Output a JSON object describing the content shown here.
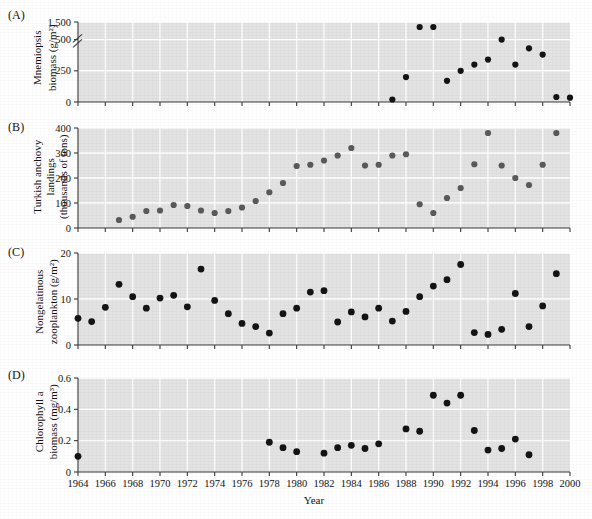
{
  "figure": {
    "background": "#ffffff",
    "panel_bg": "#e3e3e3",
    "gridline_color": "#ffffff",
    "axis_color": "#3a3a3a",
    "xaxis_title": "Year",
    "x_ticks": [
      "1964",
      "1966",
      "1968",
      "1970",
      "1972",
      "1974",
      "1976",
      "1978",
      "1980",
      "1982",
      "1984",
      "1986",
      "1988",
      "1990",
      "1992",
      "1994",
      "1996",
      "1998",
      "2000"
    ],
    "x_range": [
      1964,
      2000
    ]
  },
  "panels": [
    {
      "letter": "(A)",
      "ylabel_line1": "Mnemiopsis",
      "ylabel_line1_italic": true,
      "ylabel_line2": "biomass (g/m²)",
      "y_ticks": [
        "0",
        "250",
        "500",
        "1,500"
      ],
      "y_tick_values": [
        0,
        250,
        500,
        1500
      ],
      "axis_break": true,
      "marker_color": "#141414",
      "marker_radius": 3.1
    },
    {
      "letter": "(B)",
      "ylabel_line1": "Turkish anchovy",
      "ylabel_line2": "landings",
      "ylabel_line3": "(thousands of tons)",
      "y_ticks": [
        "0",
        "100",
        "200",
        "300",
        "400"
      ],
      "y_tick_values": [
        0,
        100,
        200,
        300,
        400
      ],
      "axis_break": false,
      "marker_color": "#5a5a5a",
      "marker_radius": 3.1
    },
    {
      "letter": "(C)",
      "ylabel_line1": "Nongelatinous",
      "ylabel_line2": "zooplankton (g/m²)",
      "y_ticks": [
        "0",
        "10",
        "20"
      ],
      "y_tick_values": [
        0,
        10,
        20
      ],
      "axis_break": false,
      "marker_color": "#141414",
      "marker_radius": 3.4
    },
    {
      "letter": "(D)",
      "ylabel_line1": "Chlorophyll a",
      "ylabel_line1_italic_last": true,
      "ylabel_line2": "biomass (mg/m³)",
      "y_ticks": [
        "0",
        "0.2",
        "0.4",
        "0.6"
      ],
      "y_tick_values": [
        0,
        0.2,
        0.4,
        0.6
      ],
      "axis_break": false,
      "marker_color": "#141414",
      "marker_radius": 3.4
    }
  ],
  "chart_data": [
    {
      "type": "scatter",
      "panel": "A",
      "title": "Mnemiopsis biomass",
      "xlabel": "Year",
      "ylabel": "Mnemiopsis biomass (g/m²)",
      "xlim": [
        1964,
        2000
      ],
      "ylim": [
        0,
        1500
      ],
      "y_broken_axis": true,
      "y_break_between": [
        500,
        1500
      ],
      "grid": true,
      "legend": "none",
      "x": [
        1987,
        1988,
        1989,
        1990,
        1991,
        1992,
        1993,
        1994,
        1995,
        1996,
        1997,
        1998,
        1999
      ],
      "values": [
        20,
        200,
        1500,
        1500,
        170,
        250,
        300,
        340,
        500,
        300,
        430,
        380,
        40
      ],
      "points": [
        {
          "x": 1987,
          "y": 20
        },
        {
          "x": 1988,
          "y": 200
        },
        {
          "x": 1989,
          "y": 1500
        },
        {
          "x": 1990,
          "y": 1500
        },
        {
          "x": 1991,
          "y": 170
        },
        {
          "x": 1992,
          "y": 250
        },
        {
          "x": 1993,
          "y": 300
        },
        {
          "x": 1994,
          "y": 340
        },
        {
          "x": 1995,
          "y": 500
        },
        {
          "x": 1996,
          "y": 300
        },
        {
          "x": 1997,
          "y": 430
        },
        {
          "x": 1998,
          "y": 380
        },
        {
          "x": 1999,
          "y": 40
        },
        {
          "x": 2000,
          "y": 35
        }
      ]
    },
    {
      "type": "scatter",
      "panel": "B",
      "title": "Turkish anchovy landings",
      "xlabel": "Year",
      "ylabel": "Turkish anchovy landings (thousands of tons)",
      "xlim": [
        1964,
        2000
      ],
      "ylim": [
        0,
        400
      ],
      "grid": true,
      "legend": "none",
      "x": [
        1967,
        1968,
        1969,
        1970,
        1971,
        1972,
        1973,
        1974,
        1975,
        1976,
        1977,
        1978,
        1979,
        1980,
        1981,
        1982,
        1983,
        1984,
        1985,
        1986,
        1987,
        1988,
        1989,
        1990,
        1991,
        1992,
        1993,
        1994,
        1995,
        1996,
        1997,
        1998,
        1999
      ],
      "values": [
        32,
        45,
        68,
        70,
        92,
        88,
        70,
        60,
        68,
        82,
        108,
        143,
        180,
        248,
        253,
        270,
        290,
        320,
        250,
        253,
        290,
        295,
        95,
        60,
        85,
        160,
        130,
        250,
        245,
        170,
        205,
        285,
        400
      ],
      "points": [
        {
          "x": 1967,
          "y": 32
        },
        {
          "x": 1968,
          "y": 45
        },
        {
          "x": 1969,
          "y": 68
        },
        {
          "x": 1970,
          "y": 70
        },
        {
          "x": 1971,
          "y": 92
        },
        {
          "x": 1972,
          "y": 88
        },
        {
          "x": 1973,
          "y": 70
        },
        {
          "x": 1974,
          "y": 60
        },
        {
          "x": 1975,
          "y": 68
        },
        {
          "x": 1976,
          "y": 82
        },
        {
          "x": 1977,
          "y": 108
        },
        {
          "x": 1978,
          "y": 143
        },
        {
          "x": 1979,
          "y": 180
        },
        {
          "x": 1980,
          "y": 248
        },
        {
          "x": 1981,
          "y": 253
        },
        {
          "x": 1982,
          "y": 270
        },
        {
          "x": 1983,
          "y": 290
        },
        {
          "x": 1984,
          "y": 320
        },
        {
          "x": 1985,
          "y": 250
        },
        {
          "x": 1986,
          "y": 253
        },
        {
          "x": 1987,
          "y": 290
        },
        {
          "x": 1988,
          "y": 295
        },
        {
          "x": 1989,
          "y": 95
        },
        {
          "x": 1990,
          "y": 60
        },
        {
          "x": 1991,
          "y": 120
        },
        {
          "x": 1992,
          "y": 160
        },
        {
          "x": 1993,
          "y": 255
        },
        {
          "x": 1994,
          "y": 380
        },
        {
          "x": 1995,
          "y": 250
        },
        {
          "x": 1996,
          "y": 200
        },
        {
          "x": 1997,
          "y": 172
        },
        {
          "x": 1998,
          "y": 253
        },
        {
          "x": 1999,
          "y": 400
        }
      ]
    },
    {
      "type": "scatter",
      "panel": "C",
      "title": "Nongelatinous zooplankton",
      "xlabel": "Year",
      "ylabel": "Nongelatinous zooplankton (g/m²)",
      "xlim": [
        1964,
        2000
      ],
      "ylim": [
        0,
        20
      ],
      "grid": true,
      "legend": "none",
      "x": [
        1964,
        1965,
        1966,
        1967,
        1968,
        1969,
        1970,
        1971,
        1972,
        1973,
        1974,
        1975,
        1976,
        1977,
        1978,
        1979,
        1980,
        1981,
        1982,
        1983,
        1984,
        1985,
        1986,
        1987,
        1988,
        1989,
        1990,
        1991,
        1992,
        1993,
        1994,
        1995,
        1996,
        1999
      ],
      "values": [
        5.8,
        5.1,
        8.2,
        13.2,
        10.5,
        8.0,
        10.2,
        10.8,
        16.5,
        8.3,
        9.7,
        6.8,
        4.7,
        4.0,
        2.6,
        6.8,
        11.5,
        11.8,
        8.0,
        5.0,
        7.2,
        6.0,
        5.2,
        8.0,
        9.2,
        12.0,
        14.0,
        17.5,
        2.7,
        2.3,
        3.3,
        11.2,
        8.5,
        15.5
      ],
      "points": [
        {
          "x": 1964,
          "y": 5.8
        },
        {
          "x": 1965,
          "y": 5.1
        },
        {
          "x": 1966,
          "y": 8.2
        },
        {
          "x": 1967,
          "y": 13.2
        },
        {
          "x": 1968,
          "y": 10.5
        },
        {
          "x": 1969,
          "y": 8.0
        },
        {
          "x": 1970,
          "y": 10.2
        },
        {
          "x": 1971,
          "y": 10.8
        },
        {
          "x": 1972,
          "y": 8.3
        },
        {
          "x": 1973,
          "y": 16.5
        },
        {
          "x": 1974,
          "y": 9.7
        },
        {
          "x": 1975,
          "y": 6.8
        },
        {
          "x": 1976,
          "y": 4.7
        },
        {
          "x": 1977,
          "y": 4.0
        },
        {
          "x": 1978,
          "y": 2.6
        },
        {
          "x": 1979,
          "y": 6.8
        },
        {
          "x": 1980,
          "y": 8.0
        },
        {
          "x": 1981,
          "y": 11.5
        },
        {
          "x": 1982,
          "y": 11.8
        },
        {
          "x": 1983,
          "y": 5.0
        },
        {
          "x": 1984,
          "y": 7.2
        },
        {
          "x": 1985,
          "y": 6.1
        },
        {
          "x": 1986,
          "y": 8.0
        },
        {
          "x": 1987,
          "y": 5.2
        },
        {
          "x": 1988,
          "y": 7.3
        },
        {
          "x": 1989,
          "y": 10.5
        },
        {
          "x": 1990,
          "y": 12.8
        },
        {
          "x": 1991,
          "y": 14.2
        },
        {
          "x": 1992,
          "y": 17.5
        },
        {
          "x": 1993,
          "y": 2.7
        },
        {
          "x": 1994,
          "y": 2.3
        },
        {
          "x": 1995,
          "y": 3.4
        },
        {
          "x": 1996,
          "y": 11.2
        },
        {
          "x": 1997,
          "y": 4.0
        },
        {
          "x": 1998,
          "y": 8.5
        },
        {
          "x": 1999,
          "y": 15.5
        }
      ]
    },
    {
      "type": "scatter",
      "panel": "D",
      "title": "Chlorophyll a biomass",
      "xlabel": "Year",
      "ylabel": "Chlorophyll a biomass (mg/m³)",
      "xlim": [
        1964,
        2000
      ],
      "ylim": [
        0,
        0.6
      ],
      "grid": true,
      "legend": "none",
      "x": [
        1964,
        1978,
        1979,
        1980,
        1982,
        1983,
        1984,
        1985,
        1986,
        1988,
        1989,
        1990,
        1991,
        1992,
        1993,
        1994,
        1995,
        1996,
        1997
      ],
      "values": [
        0.1,
        0.19,
        0.155,
        0.13,
        0.12,
        0.155,
        0.17,
        0.15,
        0.18,
        0.275,
        0.26,
        0.49,
        0.44,
        0.49,
        0.265,
        0.14,
        0.15,
        0.21,
        0.11
      ],
      "points": [
        {
          "x": 1964,
          "y": 0.1
        },
        {
          "x": 1978,
          "y": 0.19
        },
        {
          "x": 1979,
          "y": 0.155
        },
        {
          "x": 1980,
          "y": 0.13
        },
        {
          "x": 1982,
          "y": 0.12
        },
        {
          "x": 1983,
          "y": 0.155
        },
        {
          "x": 1984,
          "y": 0.17
        },
        {
          "x": 1985,
          "y": 0.15
        },
        {
          "x": 1986,
          "y": 0.18
        },
        {
          "x": 1988,
          "y": 0.275
        },
        {
          "x": 1989,
          "y": 0.26
        },
        {
          "x": 1990,
          "y": 0.49
        },
        {
          "x": 1991,
          "y": 0.44
        },
        {
          "x": 1992,
          "y": 0.49
        },
        {
          "x": 1993,
          "y": 0.265
        },
        {
          "x": 1994,
          "y": 0.14
        },
        {
          "x": 1995,
          "y": 0.15
        },
        {
          "x": 1996,
          "y": 0.21
        },
        {
          "x": 1997,
          "y": 0.11
        }
      ]
    }
  ]
}
